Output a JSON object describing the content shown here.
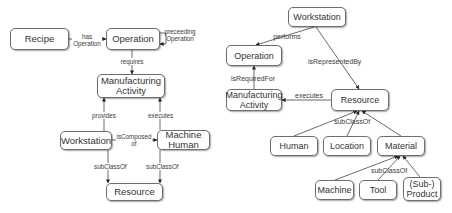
{
  "diagrams": [
    {
      "id": "left",
      "nodes": [
        {
          "key": "recipe",
          "label": "Recipe"
        },
        {
          "key": "operation",
          "label": "Operation"
        },
        {
          "key": "manufacturing_activity",
          "label": "Manufacturing\nActivity"
        },
        {
          "key": "workstation",
          "label": "Workstation"
        },
        {
          "key": "machine_human",
          "label": "Machine\nHuman"
        },
        {
          "key": "resource",
          "label": "Resource"
        }
      ],
      "edges": [
        {
          "from": "recipe",
          "to": "operation",
          "label": "has\nOperation"
        },
        {
          "from": "operation",
          "to": "operation",
          "label": "preceeding\nOperation"
        },
        {
          "from": "operation",
          "to": "manufacturing_activity",
          "label": "requires"
        },
        {
          "from": "workstation",
          "to": "manufacturing_activity",
          "label": "provides"
        },
        {
          "from": "machine_human",
          "to": "manufacturing_activity",
          "label": "executes"
        },
        {
          "from": "workstation",
          "to": "machine_human",
          "label": "isComposed\nof"
        },
        {
          "from": "workstation",
          "to": "resource",
          "label": "subClassOf"
        },
        {
          "from": "machine_human",
          "to": "resource",
          "label": "subClassOf"
        }
      ]
    },
    {
      "id": "right",
      "nodes": [
        {
          "key": "workstation",
          "label": "Workstation"
        },
        {
          "key": "operation",
          "label": "Operation"
        },
        {
          "key": "manufacturing_activity",
          "label": "Manufacturing\nActivity"
        },
        {
          "key": "resource",
          "label": "Resource"
        },
        {
          "key": "human",
          "label": "Human"
        },
        {
          "key": "location",
          "label": "Location"
        },
        {
          "key": "material",
          "label": "Material"
        },
        {
          "key": "machine",
          "label": "Machine"
        },
        {
          "key": "tool",
          "label": "Tool"
        },
        {
          "key": "sub_product",
          "label": "(Sub-)\nProduct"
        }
      ],
      "edges": [
        {
          "from": "workstation",
          "to": "operation",
          "label": "performs"
        },
        {
          "from": "workstation",
          "to": "resource",
          "label": "isRepresentedBy"
        },
        {
          "from": "manufacturing_activity",
          "to": "operation",
          "label": "isRequiredFor"
        },
        {
          "from": "resource",
          "to": "manufacturing_activity",
          "label": "executes"
        },
        {
          "from": "human",
          "to": "resource",
          "label": "subClassOf"
        },
        {
          "from": "location",
          "to": "resource",
          "label": "subClassOf"
        },
        {
          "from": "material",
          "to": "resource",
          "label": "subClassOf"
        },
        {
          "from": "machine",
          "to": "material",
          "label": "subClassOf"
        },
        {
          "from": "tool",
          "to": "material",
          "label": "subClassOf"
        },
        {
          "from": "sub_product",
          "to": "material",
          "label": "subClassOf"
        }
      ]
    }
  ],
  "colors": {
    "border": "#6e6e6e",
    "edge": "#333333",
    "text": "#333333",
    "background": "#ffffff"
  }
}
